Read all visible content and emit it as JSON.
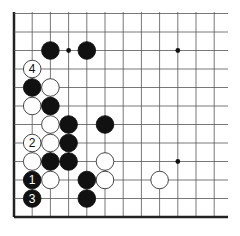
{
  "diagram": {
    "type": "go-board-fragment",
    "colors": {
      "background": "#ffffff",
      "grid_line": "#555555",
      "edge_line": "#222222",
      "black_stone": "#111111",
      "white_stone": "#ffffff",
      "white_stone_outline": "#333333",
      "star_point": "#111111"
    },
    "grid": {
      "origin_x": 14,
      "origin_y": 217,
      "spacing_x": 18.2,
      "spacing_y": 18.5,
      "columns": 12,
      "rows": 11,
      "right_extent": 228,
      "top_extent": 12,
      "edges": [
        "left",
        "bottom"
      ]
    },
    "star_points": [
      {
        "col": 3,
        "row": 9
      },
      {
        "col": 9,
        "row": 9
      },
      {
        "col": 9,
        "row": 3
      }
    ],
    "stones": [
      {
        "color": "black",
        "col": 2,
        "row": 9,
        "label": ""
      },
      {
        "color": "black",
        "col": 4,
        "row": 9,
        "label": ""
      },
      {
        "color": "white",
        "col": 1,
        "row": 8,
        "label": "4"
      },
      {
        "color": "black",
        "col": 1,
        "row": 7,
        "label": ""
      },
      {
        "color": "white",
        "col": 2,
        "row": 7,
        "label": ""
      },
      {
        "color": "white",
        "col": 1,
        "row": 6,
        "label": ""
      },
      {
        "color": "black",
        "col": 2,
        "row": 6,
        "label": ""
      },
      {
        "color": "white",
        "col": 2,
        "row": 5,
        "label": ""
      },
      {
        "color": "black",
        "col": 3,
        "row": 5,
        "label": ""
      },
      {
        "color": "black",
        "col": 5,
        "row": 5,
        "label": ""
      },
      {
        "color": "white",
        "col": 1,
        "row": 4,
        "label": "2"
      },
      {
        "color": "white",
        "col": 2,
        "row": 4,
        "label": ""
      },
      {
        "color": "black",
        "col": 3,
        "row": 4,
        "label": ""
      },
      {
        "color": "white",
        "col": 1,
        "row": 3,
        "label": ""
      },
      {
        "color": "black",
        "col": 2,
        "row": 3,
        "label": ""
      },
      {
        "color": "black",
        "col": 3,
        "row": 3,
        "label": ""
      },
      {
        "color": "white",
        "col": 5,
        "row": 3,
        "label": ""
      },
      {
        "color": "black",
        "col": 1,
        "row": 2,
        "label": "1"
      },
      {
        "color": "white",
        "col": 2,
        "row": 2,
        "label": ""
      },
      {
        "color": "black",
        "col": 4,
        "row": 2,
        "label": ""
      },
      {
        "color": "white",
        "col": 5,
        "row": 2,
        "label": ""
      },
      {
        "color": "white",
        "col": 8,
        "row": 2,
        "label": ""
      },
      {
        "color": "black",
        "col": 1,
        "row": 1,
        "label": "3"
      },
      {
        "color": "black",
        "col": 4,
        "row": 1,
        "label": ""
      }
    ]
  }
}
